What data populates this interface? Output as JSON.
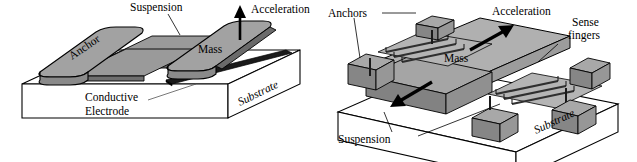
{
  "figure": {
    "panels": [
      {
        "id": "parallel-plate",
        "name": "Parallel-plate (out-of-plane) accelerometer",
        "labels": {
          "anchor": "Anchor",
          "suspension": "Suspension",
          "acceleration": "Acceleration",
          "mass": "Mass",
          "substrate": "Substrate",
          "electrode_line1": "Conductive",
          "electrode_line2": "Electrode"
        }
      },
      {
        "id": "comb-finger",
        "name": "Comb-finger (in-plane) accelerometer",
        "labels": {
          "anchors": "Anchors",
          "acceleration": "Acceleration",
          "sense_line1": "Sense",
          "sense_line2": "fingers",
          "mass": "Mass",
          "suspension": "Suspension",
          "substrate": "Substrate"
        }
      }
    ]
  },
  "colors": {
    "outline": "#000000",
    "substrate_face": "#ffffff",
    "mass_top": "#a8a8a8",
    "mass_side": "#8c8c8c",
    "mass_dark": "#707070",
    "electrode": "#1a1a1a",
    "finger": "#3a3a3a",
    "leader": "#000000",
    "background": "#ffffff"
  }
}
